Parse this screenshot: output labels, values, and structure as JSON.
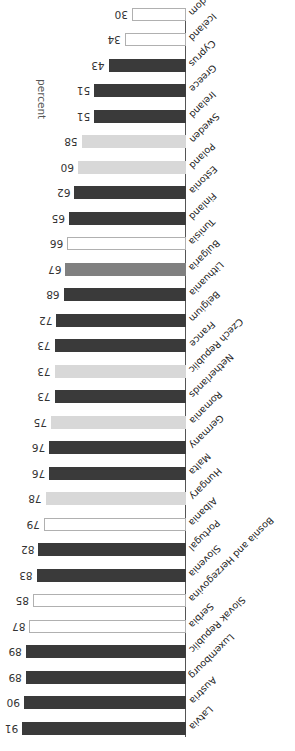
{
  "chart_data": {
    "type": "bar",
    "orientation": "horizontal",
    "title": "",
    "subtitle": "",
    "xlabel": "percent",
    "ylabel": "",
    "xlim": [
      0,
      91
    ],
    "grid": false,
    "legend": null,
    "rotation_note": "figure rendered upside-down (180 degrees)",
    "categories": [
      "Latvia",
      "Austria",
      "Luxembourg",
      "Slovak Republic",
      "Serbia",
      "Bosnia and Herzegovina",
      "Slovenia",
      "Portugal",
      "Albania",
      "Hungary",
      "Malta",
      "Germany",
      "Romania",
      "Netherlands",
      "Czech Republic",
      "France",
      "Belgium",
      "Lithuania",
      "Bulgaria",
      "Tunisia",
      "Finland",
      "Estonia",
      "Poland",
      "Sweden",
      "Ireland",
      "Greece",
      "Cyprus",
      "Iceland",
      "United Kingdom"
    ],
    "values": [
      91,
      90,
      89,
      89,
      87,
      85,
      83,
      82,
      79,
      78,
      76,
      76,
      75,
      73,
      73,
      73,
      72,
      68,
      67,
      66,
      65,
      62,
      60,
      58,
      51,
      51,
      43,
      34,
      30
    ],
    "bar_styles": [
      "dark",
      "dark",
      "dark",
      "dark",
      "white",
      "white",
      "dark",
      "dark",
      "white",
      "light",
      "dark",
      "dark",
      "light",
      "dark",
      "light",
      "dark",
      "dark",
      "dark",
      "mid",
      "white",
      "dark",
      "dark",
      "light",
      "light",
      "dark",
      "dark",
      "dark",
      "white",
      "white"
    ],
    "colors": {
      "dark": "#3a3a3a",
      "light": "#d8d8d8",
      "mid": "#808080",
      "white": "#ffffff",
      "white_border": "#b0b0b0",
      "axis": "#555555",
      "text": "#333333"
    }
  }
}
